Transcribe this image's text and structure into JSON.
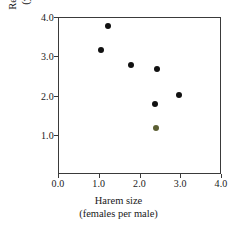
{
  "chart_data": {
    "type": "scatter",
    "title": "",
    "xlabel": "Harem size (females per male)",
    "xlabel_lines": [
      "Harem size",
      "(females per male)"
    ],
    "ylabel": "Reproductive success (young per female)",
    "ylabel_lines": [
      "Reproductive success",
      "(young per female)"
    ],
    "xlim": [
      0.0,
      4.0
    ],
    "ylim": [
      0.0,
      4.0
    ],
    "xticks": [
      "0.0",
      "1.0",
      "2.0",
      "3.0",
      "4.0"
    ],
    "xtick_values": [
      0.0,
      1.0,
      2.0,
      3.0,
      4.0
    ],
    "yticks": [
      "1.0",
      "2.0",
      "3.0",
      "4.0"
    ],
    "ytick_values": [
      1.0,
      2.0,
      3.0,
      4.0
    ],
    "grid": false,
    "legend": null,
    "marker": "filled-circle",
    "marker_color": "#111111",
    "points": [
      {
        "x": 1.23,
        "y": 3.77,
        "color": "#111111"
      },
      {
        "x": 1.06,
        "y": 3.16,
        "color": "#111111"
      },
      {
        "x": 1.79,
        "y": 2.78,
        "color": "#111111"
      },
      {
        "x": 2.43,
        "y": 2.68,
        "color": "#111111"
      },
      {
        "x": 2.97,
        "y": 2.01,
        "color": "#111111"
      },
      {
        "x": 2.38,
        "y": 1.78,
        "color": "#111111"
      },
      {
        "x": 2.41,
        "y": 1.18,
        "color": "#5c5f33"
      }
    ]
  },
  "style": {
    "background": "#ffffff",
    "axis_color": "#3a3a3a",
    "text_color": "#1a1a1a"
  }
}
